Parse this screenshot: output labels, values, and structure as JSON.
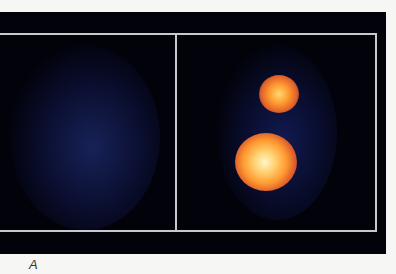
{
  "figure": {
    "label": "A",
    "panels": [
      {
        "name": "left",
        "description": "diffuse blue uptake"
      },
      {
        "name": "right",
        "description": "two focal hot spots (upper small, lower large)"
      }
    ],
    "colors": {
      "background": "#02020a",
      "frame": "#c9c9cc",
      "diffuse_blue": "#1a2a7a",
      "hot_core": "#fff2b0",
      "hot_mid": "#ff9a2a",
      "hot_edge": "#c8401a"
    }
  }
}
